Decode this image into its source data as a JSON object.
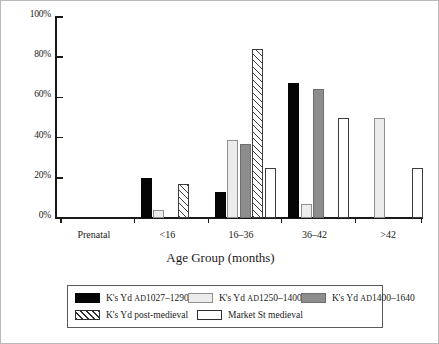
{
  "chart_data": {
    "type": "bar",
    "title": "",
    "xlabel": "Age Group (months)",
    "ylabel": "",
    "ylim": [
      0,
      100
    ],
    "yticks": [
      "0%",
      "20%",
      "40%",
      "60%",
      "80%",
      "100%"
    ],
    "ytick_values": [
      0,
      20,
      40,
      60,
      80,
      100
    ],
    "grid": false,
    "legend_position": "bottom",
    "categories": [
      "Prenatal",
      "<16",
      "16–36",
      "36–42",
      ">42"
    ],
    "series": [
      {
        "name": "K's Yd AD1027–1290",
        "name_prefix": "K's Yd ",
        "name_smallcaps": "AD",
        "name_suffix": "1027–1290",
        "style": "s-black",
        "swatch": "black-solid",
        "values": [
          0,
          20,
          13,
          67,
          0
        ]
      },
      {
        "name": "K's Yd AD1250–1400",
        "name_prefix": "K's Yd ",
        "name_smallcaps": "AD",
        "name_suffix": "1250–1400",
        "style": "s-light",
        "swatch": "light-gray-solid",
        "values": [
          0,
          4,
          39,
          7,
          50
        ]
      },
      {
        "name": "K's Yd AD1400–1640",
        "name_prefix": "K's Yd ",
        "name_smallcaps": "AD",
        "name_suffix": "1400–1640",
        "style": "s-gray",
        "swatch": "mid-gray-solid",
        "values": [
          0,
          0,
          37,
          64,
          0
        ]
      },
      {
        "name": "K's Yd post-medieval",
        "name_prefix": "K's Yd post-medieval",
        "name_smallcaps": "",
        "name_suffix": "",
        "style": "s-hatch",
        "swatch": "diagonal-hatch",
        "values": [
          0,
          17,
          84,
          0,
          0
        ]
      },
      {
        "name": "Market St medieval",
        "name_prefix": "Market St medieval",
        "name_smallcaps": "",
        "name_suffix": "",
        "style": "s-white",
        "swatch": "white-outline",
        "values": [
          0,
          0,
          25,
          50,
          25
        ]
      }
    ]
  },
  "colors": {
    "black_series": "#050505",
    "light_series": "#ececec",
    "gray_series": "#8d8d8d",
    "hatch_series": "#ffffff",
    "white_series": "#ffffff",
    "axis": "#1a1a1a",
    "frame": "#b9b9b9"
  }
}
